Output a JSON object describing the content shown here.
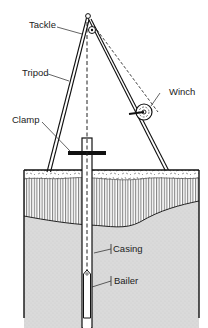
{
  "diagram": {
    "type": "well-drilling-cable-tool-rig",
    "labels": {
      "tackle": "Tackle",
      "tripod": "Tripod",
      "winch": "Winch",
      "clamp": "Clamp",
      "casing": "Casing",
      "bailer": "Bailer"
    },
    "layers": [
      {
        "name": "topsoil",
        "pattern": "speckled"
      },
      {
        "name": "clay",
        "pattern": "vertical-hatch"
      },
      {
        "name": "sand-aquifer",
        "pattern": "stippled-gray"
      }
    ],
    "colors": {
      "line": "#1a1a1a",
      "sand": "#d9d9d9",
      "background": "#ffffff"
    }
  }
}
